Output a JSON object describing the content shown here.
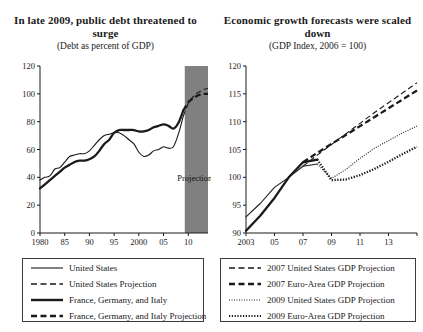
{
  "figure": {
    "width": 423,
    "height": 332,
    "background": "#ffffff",
    "ink_color": "#1a1a1a",
    "projection_band_color": "#808080"
  },
  "panels": [
    {
      "id": "public-debt",
      "title": "In late 2009, public debt threatened to surge",
      "subtitle": "(Debt as percent of GDP)",
      "annotation": "Projections",
      "legend": [
        {
          "label": "United States",
          "style": "solid",
          "weight": "thin"
        },
        {
          "label": "United States Projection",
          "style": "dashed",
          "weight": "thin"
        },
        {
          "label": "France, Germany, and Italy",
          "style": "solid",
          "weight": "thick"
        },
        {
          "label": "France, Germany, and Italy Projection",
          "style": "dashed",
          "weight": "thick"
        }
      ]
    },
    {
      "id": "growth-forecasts",
      "title": "Economic growth forecasts were scaled down",
      "subtitle": "(GDP Index, 2006 = 100)",
      "legend": [
        {
          "label": "2007 United States GDP Projection",
          "style": "dashed",
          "weight": "thin"
        },
        {
          "label": "2007 Euro-Area GDP Projection",
          "style": "dashed",
          "weight": "thick"
        },
        {
          "label": "2009 United States GDP Projection",
          "style": "dotted",
          "weight": "thin"
        },
        {
          "label": "2009 Euro-Area GDP Projection",
          "style": "dotted",
          "weight": "thick"
        }
      ]
    }
  ],
  "chart_data": [
    {
      "type": "line",
      "title": "In late 2009, public debt threatened to surge",
      "subtitle": "(Debt as percent of GDP)",
      "xlabel": "",
      "ylabel": "Debt as percent of GDP",
      "xlim": [
        1980,
        2014
      ],
      "ylim": [
        0,
        120
      ],
      "yticks": [
        0,
        20,
        40,
        60,
        80,
        100,
        120
      ],
      "xticks": [
        1980,
        1985,
        1990,
        1995,
        2000,
        2005,
        2010
      ],
      "xtick_labels": [
        "1980",
        "85",
        "90",
        "95",
        "2000",
        "05",
        "10"
      ],
      "grid": false,
      "legend_position": "below",
      "shaded_region": {
        "label": "Projections",
        "x_start": 2009.3,
        "x_end": 2014
      },
      "series": [
        {
          "name": "United States",
          "style": "solid",
          "weight": "thin",
          "x": [
            1980,
            1981,
            1982,
            1983,
            1984,
            1985,
            1986,
            1987,
            1988,
            1989,
            1990,
            1991,
            1992,
            1993,
            1994,
            1995,
            1996,
            1997,
            1998,
            1999,
            2000,
            2001,
            2002,
            2003,
            2004,
            2005,
            2006,
            2007,
            2008,
            2009
          ],
          "values": [
            38,
            40,
            41,
            46,
            47,
            51,
            55,
            56,
            57,
            57,
            59,
            63,
            67,
            70,
            71,
            72,
            72,
            70,
            67,
            64,
            58,
            55,
            56,
            59,
            60,
            62,
            61,
            62,
            71,
            84
          ]
        },
        {
          "name": "United States Projection",
          "style": "dashed",
          "weight": "thin",
          "x": [
            2009,
            2010,
            2011,
            2012,
            2013,
            2014
          ],
          "values": [
            84,
            93,
            98,
            101,
            103,
            104
          ]
        },
        {
          "name": "France, Germany, and Italy",
          "style": "solid",
          "weight": "thick",
          "x": [
            1980,
            1981,
            1982,
            1983,
            1984,
            1985,
            1986,
            1987,
            1988,
            1989,
            1990,
            1991,
            1992,
            1993,
            1994,
            1995,
            1996,
            1997,
            1998,
            1999,
            2000,
            2001,
            2002,
            2003,
            2004,
            2005,
            2006,
            2007,
            2008,
            2009
          ],
          "values": [
            32,
            35,
            38,
            41,
            44,
            47,
            49,
            51,
            52,
            52,
            53,
            55,
            59,
            64,
            67,
            72,
            74,
            74,
            74,
            74,
            73,
            73,
            74,
            76,
            77,
            78,
            77,
            75,
            79,
            88
          ]
        },
        {
          "name": "France, Germany, and Italy Projection",
          "style": "dashed",
          "weight": "thick",
          "x": [
            2009,
            2010,
            2011,
            2012,
            2013,
            2014
          ],
          "values": [
            88,
            94,
            97,
            99,
            100,
            100
          ]
        }
      ]
    },
    {
      "type": "line",
      "title": "Economic growth forecasts were scaled down",
      "subtitle": "(GDP Index, 2006 = 100)",
      "xlabel": "",
      "ylabel": "GDP Index, 2006 = 100",
      "xlim": [
        2003,
        2015
      ],
      "ylim": [
        90,
        120
      ],
      "yticks": [
        90,
        95,
        100,
        105,
        110,
        115,
        120
      ],
      "xticks": [
        2003,
        2005,
        2007,
        2009,
        2011,
        2013,
        2015
      ],
      "xtick_labels": [
        "2003",
        "05",
        "07",
        "09",
        "11",
        "13",
        ""
      ],
      "grid": false,
      "legend_position": "below",
      "series": [
        {
          "name": "United States history",
          "style": "solid",
          "weight": "thin",
          "x": [
            2003,
            2004,
            2005,
            2006,
            2007,
            2008
          ],
          "values": [
            92.9,
            95.3,
            98.2,
            100.0,
            102.0,
            102.4
          ]
        },
        {
          "name": "Euro-Area history",
          "style": "solid",
          "weight": "thick",
          "x": [
            2003,
            2004,
            2005,
            2006,
            2007,
            2008
          ],
          "values": [
            90.4,
            93.1,
            96.3,
            100.0,
            102.7,
            103.2
          ]
        },
        {
          "name": "2007 United States GDP Projection",
          "style": "dashed",
          "weight": "thin",
          "x": [
            2007,
            2008,
            2009,
            2010,
            2011,
            2012,
            2013,
            2014,
            2015
          ],
          "values": [
            102.0,
            104.0,
            105.9,
            107.8,
            109.7,
            111.6,
            113.4,
            115.2,
            117.0
          ]
        },
        {
          "name": "2007 Euro-Area GDP Projection",
          "style": "dashed",
          "weight": "thick",
          "x": [
            2007,
            2008,
            2009,
            2010,
            2011,
            2012,
            2013,
            2014,
            2015
          ],
          "values": [
            102.7,
            104.4,
            106.0,
            107.6,
            109.2,
            110.8,
            112.4,
            114.0,
            115.6
          ]
        },
        {
          "name": "2009 United States GDP Projection",
          "style": "dotted",
          "weight": "thin",
          "x": [
            2008,
            2009,
            2010,
            2011,
            2012,
            2013,
            2014,
            2015
          ],
          "values": [
            102.4,
            99.8,
            101.4,
            103.4,
            105.2,
            106.6,
            108.0,
            109.2
          ]
        },
        {
          "name": "2009 Euro-Area GDP Projection",
          "style": "dotted",
          "weight": "thick",
          "x": [
            2008,
            2009,
            2010,
            2011,
            2012,
            2013,
            2014,
            2015
          ],
          "values": [
            103.2,
            99.5,
            99.6,
            100.4,
            101.5,
            102.8,
            104.2,
            105.5
          ]
        }
      ]
    }
  ]
}
